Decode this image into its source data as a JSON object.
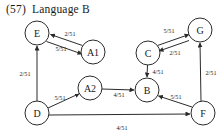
{
  "title": {
    "number": "(57)",
    "text": "Language B"
  },
  "diagram": {
    "type": "directed-graph",
    "nodes": [
      {
        "id": "E",
        "label": "E",
        "cx": 37,
        "cy": 33,
        "r": 12
      },
      {
        "id": "A1",
        "label": "A1",
        "cx": 93,
        "cy": 52,
        "r": 12
      },
      {
        "id": "C",
        "label": "C",
        "cx": 148,
        "cy": 53,
        "r": 12
      },
      {
        "id": "G",
        "label": "G",
        "cx": 200,
        "cy": 30,
        "r": 12
      },
      {
        "id": "A2",
        "label": "A2",
        "cx": 90,
        "cy": 88,
        "r": 12
      },
      {
        "id": "B",
        "label": "B",
        "cx": 147,
        "cy": 90,
        "r": 12
      },
      {
        "id": "D",
        "label": "D",
        "cx": 37,
        "cy": 113,
        "r": 12
      },
      {
        "id": "F",
        "label": "F",
        "cx": 203,
        "cy": 113,
        "r": 12
      }
    ],
    "edges": [
      {
        "from": "A1",
        "to": "E",
        "label": "2/51",
        "label_x": 70,
        "label_y": 33
      },
      {
        "from": "E",
        "to": "A1",
        "label": "5/51",
        "label_x": 61,
        "label_y": 48
      },
      {
        "from": "D",
        "to": "E",
        "label": "2/51",
        "label_x": 25,
        "label_y": 73
      },
      {
        "from": "D",
        "to": "A2",
        "label": "5/51",
        "label_x": 60,
        "label_y": 97
      },
      {
        "from": "A2",
        "to": "B",
        "label": "4/51",
        "label_x": 119,
        "label_y": 94
      },
      {
        "from": "C",
        "to": "G",
        "label": "5/51",
        "label_x": 169,
        "label_y": 30
      },
      {
        "from": "G",
        "to": "C",
        "label": "2/51",
        "label_x": 175,
        "label_y": 52
      },
      {
        "from": "C",
        "to": "B",
        "label": "4/51",
        "label_x": 158,
        "label_y": 71
      },
      {
        "from": "F",
        "to": "B",
        "label": "5/51",
        "label_x": 176,
        "label_y": 96
      },
      {
        "from": "F",
        "to": "G",
        "label": "2/51",
        "label_x": 211,
        "label_y": 72
      },
      {
        "from": "D",
        "to": "F",
        "label": "4/51",
        "label_x": 122,
        "label_y": 127
      }
    ]
  }
}
